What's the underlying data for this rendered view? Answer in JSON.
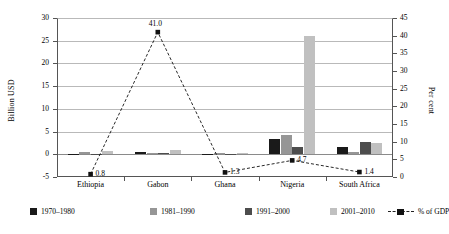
{
  "chart_data": {
    "type": "bar",
    "title": "",
    "subtitle": "",
    "xlabel": "",
    "ylabel": "Billion USD",
    "y2label": "Per cent",
    "categories": [
      "Ethiopia",
      "Gabon",
      "Ghana",
      "Nigeria",
      "South Africa"
    ],
    "ylim": [
      -5,
      30
    ],
    "y2lim": [
      0,
      45
    ],
    "yticks": [
      "30",
      "25",
      "20",
      "15",
      "10",
      "5",
      "0",
      "-5"
    ],
    "y2ticks": [
      "45",
      "40",
      "35",
      "30",
      "25",
      "20",
      "15",
      "10",
      "5",
      "0"
    ],
    "grid": true,
    "legend_position": "bottom",
    "series": [
      {
        "name": "1970–1980",
        "color": "#1a1a1a",
        "axis": "left",
        "type": "bar",
        "values": [
          -0.05,
          0.55,
          -0.05,
          3.3,
          1.5
        ]
      },
      {
        "name": "1981–1990",
        "color": "#969696",
        "axis": "left",
        "type": "bar",
        "values": [
          0.6,
          0.2,
          0.05,
          4.3,
          0.5
        ]
      },
      {
        "name": "1991–2000",
        "color": "#4d4d4d",
        "axis": "left",
        "type": "bar",
        "values": [
          -0.05,
          0.25,
          -0.1,
          1.7,
          2.7
        ]
      },
      {
        "name": "2001–2010",
        "color": "#c0c0c0",
        "axis": "left",
        "type": "bar",
        "values": [
          0.7,
          0.9,
          0.25,
          26.0,
          2.5
        ]
      },
      {
        "name": "% of GDP",
        "color": "#111111",
        "axis": "right",
        "type": "line",
        "style": "dashed",
        "marker": "square",
        "values": [
          0.8,
          41.0,
          1.3,
          4.7,
          1.4
        ],
        "labels": [
          "0.8",
          "41.0",
          "1.3",
          "4.7",
          "1.4"
        ]
      }
    ]
  },
  "legend": {
    "items": [
      {
        "label": "1970–1980"
      },
      {
        "label": "1981–1990"
      },
      {
        "label": "1991–2000"
      },
      {
        "label": "2001–2010"
      },
      {
        "label": "% of GDP"
      }
    ]
  }
}
